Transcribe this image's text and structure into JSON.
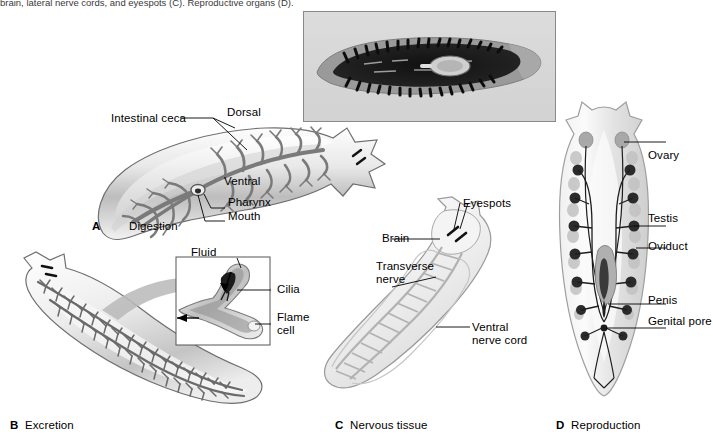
{
  "figure": {
    "caption_fragment": "brain, lateral nerve cords, and eyespots (C). Reproductive organs (D).",
    "background_color": "#ffffff",
    "ink_color": "#000000",
    "organism": "planarian flatworm"
  },
  "photo_inset": {
    "name": "planarian-photomicrograph",
    "description": "stained whole-mount planarian showing branched dark gut",
    "frame_color": "#8a8a8a",
    "background_color": "#d9d9d9",
    "specimen_color": "#1a1a1a"
  },
  "panels": [
    {
      "letter": "A",
      "title": "Digestion",
      "labels": [
        {
          "text": "Intestinal ceca"
        },
        {
          "text": "Dorsal"
        },
        {
          "text": "Ventral"
        },
        {
          "text": "Pharynx"
        },
        {
          "text": "Mouth"
        }
      ]
    },
    {
      "letter": "B",
      "title": "Excretion",
      "labels": [
        {
          "text": "Fluid"
        },
        {
          "text": "Cilia"
        },
        {
          "text": "Flame"
        },
        {
          "text": "cell"
        }
      ]
    },
    {
      "letter": "C",
      "title": "Nervous tissue",
      "labels": [
        {
          "text": "Eyespots"
        },
        {
          "text": "Brain"
        },
        {
          "text": "Transverse"
        },
        {
          "text": "nerve"
        },
        {
          "text": "Ventral"
        },
        {
          "text": "nerve cord"
        }
      ]
    },
    {
      "letter": "D",
      "title": "Reproduction",
      "labels": [
        {
          "text": "Ovary"
        },
        {
          "text": "Testis"
        },
        {
          "text": "Oviduct"
        },
        {
          "text": "Penis"
        },
        {
          "text": "Genital pore"
        }
      ]
    }
  ]
}
